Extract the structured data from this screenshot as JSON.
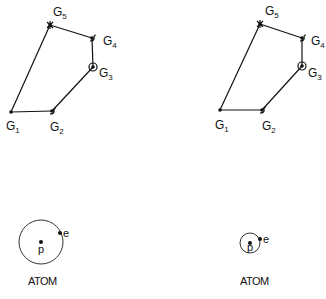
{
  "figures": [
    {
      "id": "left",
      "graph": {
        "nodes": [
          {
            "id": "G1",
            "label": "G",
            "sub": "1",
            "x": 11,
            "y": 112,
            "lx": 6,
            "ly": 130,
            "marker": "dot"
          },
          {
            "id": "G2",
            "label": "G",
            "sub": "2",
            "x": 52,
            "y": 111,
            "lx": 50,
            "ly": 131,
            "marker": "hook"
          },
          {
            "id": "G3",
            "label": "G",
            "sub": "3",
            "x": 93,
            "y": 67,
            "lx": 99,
            "ly": 77,
            "marker": "ring"
          },
          {
            "id": "G4",
            "label": "G",
            "sub": "4",
            "x": 92,
            "y": 38,
            "lx": 103,
            "ly": 45,
            "marker": "hook"
          },
          {
            "id": "G5",
            "label": "G",
            "sub": "5",
            "x": 50,
            "y": 25,
            "lx": 53,
            "ly": 16,
            "marker": "star"
          }
        ],
        "edges": [
          [
            "G1",
            "G2"
          ],
          [
            "G2",
            "G3"
          ],
          [
            "G3",
            "G4"
          ],
          [
            "G4",
            "G5"
          ],
          [
            "G5",
            "G1"
          ]
        ],
        "arrow_on": [
          "G5",
          "G1"
        ]
      },
      "atom": {
        "label": "ATOM",
        "cx": 41,
        "cy": 242,
        "r": 22,
        "proton": {
          "label": "p",
          "x": 41,
          "y": 242
        },
        "electron": {
          "label": "e",
          "x": 60,
          "y": 233
        },
        "label_x": 28,
        "label_y": 285
      }
    },
    {
      "id": "right",
      "graph": {
        "nodes": [
          {
            "id": "G1",
            "label": "G",
            "sub": "1",
            "x": 220,
            "y": 110,
            "lx": 215,
            "ly": 129,
            "marker": "dot"
          },
          {
            "id": "G2",
            "label": "G",
            "sub": "2",
            "x": 262,
            "y": 110,
            "lx": 262,
            "ly": 130,
            "marker": "hook"
          },
          {
            "id": "G3",
            "label": "G",
            "sub": "3",
            "x": 302,
            "y": 66,
            "lx": 308,
            "ly": 77,
            "marker": "ring"
          },
          {
            "id": "G4",
            "label": "G",
            "sub": "4",
            "x": 302,
            "y": 38,
            "lx": 311,
            "ly": 45,
            "marker": "hook"
          },
          {
            "id": "G5",
            "label": "G",
            "sub": "5",
            "x": 260,
            "y": 24,
            "lx": 265,
            "ly": 15,
            "marker": "star"
          }
        ],
        "edges": [
          [
            "G1",
            "G2"
          ],
          [
            "G2",
            "G3"
          ],
          [
            "G3",
            "G4"
          ],
          [
            "G4",
            "G5"
          ],
          [
            "G5",
            "G1"
          ]
        ],
        "arrow_on": [
          "G5",
          "G1"
        ]
      },
      "atom": {
        "label": "ATOM",
        "cx": 250,
        "cy": 243,
        "r": 10,
        "proton": {
          "label": "p",
          "x": 250,
          "y": 243
        },
        "electron": {
          "label": "e",
          "x": 260,
          "y": 239
        },
        "label_x": 240,
        "label_y": 285
      }
    }
  ]
}
